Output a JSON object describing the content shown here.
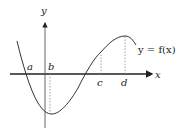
{
  "diagram": {
    "type": "function-graph",
    "axes": {
      "x_label": "x",
      "y_label": "y"
    },
    "curve_label": "y = f(x)",
    "points": {
      "a": "a",
      "b": "b",
      "c": "c",
      "d": "d"
    },
    "colors": {
      "axis": "#222222",
      "curve": "#333333",
      "guide": "#888888"
    }
  }
}
